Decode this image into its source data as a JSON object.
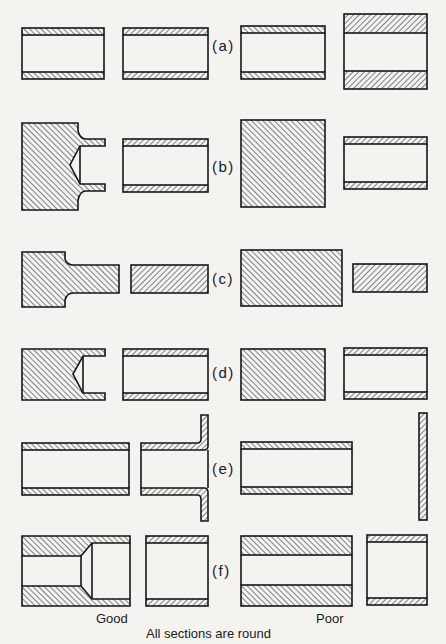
{
  "figure": {
    "column_labels": {
      "good": "Good",
      "poor": "Poor"
    },
    "caption": "All sections are round",
    "rows": [
      {
        "id": "a",
        "label": "(a)"
      },
      {
        "id": "b",
        "label": "(b)"
      },
      {
        "id": "c",
        "label": "(c)"
      },
      {
        "id": "d",
        "label": "(d)"
      },
      {
        "id": "e",
        "label": "(e)"
      },
      {
        "id": "f",
        "label": "(f)"
      }
    ],
    "colors": {
      "ink": "#161616",
      "paper": "#f4f3f0"
    }
  }
}
